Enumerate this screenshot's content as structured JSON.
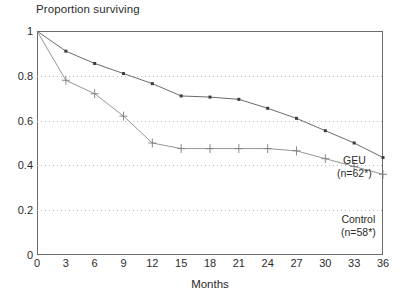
{
  "chart_data": {
    "type": "line",
    "title": "Proportion surviving",
    "xlabel": "Months",
    "ylabel": "",
    "xlim": [
      0,
      36
    ],
    "ylim": [
      0,
      1
    ],
    "grid": true,
    "grid_axis": "y",
    "legend_position": "inline-right",
    "x_ticks": [
      0,
      3,
      6,
      9,
      12,
      15,
      18,
      21,
      24,
      27,
      30,
      33,
      36
    ],
    "x_tick_labels": [
      "0",
      "3",
      "6",
      "9",
      "12",
      "15",
      "18",
      "21",
      "24",
      "27",
      "30",
      "33",
      "36"
    ],
    "y_ticks": [
      0,
      0.2,
      0.4,
      0.6,
      0.8,
      1
    ],
    "y_tick_labels": [
      "0",
      "0.2",
      "0.4",
      "0.6",
      "0.8",
      "1"
    ],
    "x": [
      0,
      3,
      6,
      9,
      12,
      15,
      18,
      21,
      24,
      27,
      30,
      33,
      36
    ],
    "series": [
      {
        "name": "GEU",
        "label": "GEU",
        "sublabel": "(n=62*)",
        "marker": "square",
        "censor_marks": false,
        "color": "#5a5a5a",
        "values": [
          1.0,
          0.91,
          0.855,
          0.81,
          0.765,
          0.71,
          0.705,
          0.695,
          0.655,
          0.61,
          0.555,
          0.5,
          0.435
        ]
      },
      {
        "name": "Control",
        "label": "Control",
        "sublabel": "(n=58*)",
        "marker": "plus",
        "censor_marks": true,
        "color": "#8a8a8a",
        "values": [
          1.0,
          0.78,
          0.72,
          0.62,
          0.5,
          0.475,
          0.475,
          0.475,
          0.475,
          0.465,
          0.43,
          0.395,
          0.36
        ]
      }
    ]
  },
  "annotations": {
    "geu_label": "GEU",
    "geu_n": "(n=62*)",
    "control_label": "Control",
    "control_n": "(n=58*)"
  }
}
